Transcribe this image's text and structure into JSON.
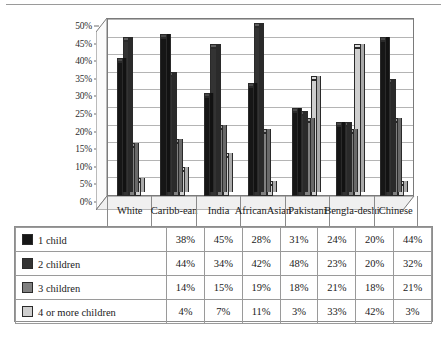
{
  "chart_data": {
    "type": "bar",
    "title": "",
    "xlabel": "",
    "ylabel": "",
    "ylim": [
      0,
      50
    ],
    "ytick_labels": [
      "0%",
      "5%",
      "10%",
      "15%",
      "20%",
      "25%",
      "30%",
      "35%",
      "40%",
      "45%",
      "50%"
    ],
    "ytick_values": [
      0,
      5,
      10,
      15,
      20,
      25,
      30,
      35,
      40,
      45,
      50
    ],
    "grid": true,
    "legend_position": "table",
    "categories": [
      "White",
      "Caribb-\nean",
      "India",
      "African\nAsian",
      "Pakistani",
      "Bengla-\ndeshi",
      "Chinese"
    ],
    "category_labels": [
      "White",
      "Caribb-ean",
      "India",
      "African Asian",
      "Pakistani",
      "Bengla-deshi",
      "Chinese"
    ],
    "series": [
      {
        "name": "1 child",
        "color": "#161616",
        "values": [
          38,
          45,
          28,
          31,
          24,
          20,
          44
        ]
      },
      {
        "name": "2 children",
        "color": "#333333",
        "values": [
          44,
          34,
          42,
          48,
          23,
          20,
          32
        ]
      },
      {
        "name": "3 children",
        "color": "#808080",
        "values": [
          14,
          15,
          19,
          18,
          21,
          18,
          21
        ]
      },
      {
        "name": "4 or more children",
        "color": "#cfcfcf",
        "values": [
          4,
          7,
          11,
          3,
          33,
          42,
          3
        ]
      }
    ]
  },
  "table": {
    "column_headers": [
      "",
      "White",
      "Caribb-ean",
      "India",
      "African Asian",
      "Pakistani",
      "Bengla-deshi",
      "Chinese"
    ],
    "rows": [
      {
        "label": "1 child",
        "swatch": "#161616",
        "values": [
          "38%",
          "45%",
          "28%",
          "31%",
          "24%",
          "20%",
          "44%"
        ]
      },
      {
        "label": "2 children",
        "swatch": "#333333",
        "values": [
          "44%",
          "34%",
          "42%",
          "48%",
          "23%",
          "20%",
          "32%"
        ]
      },
      {
        "label": "3 children",
        "swatch": "#808080",
        "values": [
          "14%",
          "15%",
          "19%",
          "18%",
          "21%",
          "18%",
          "21%"
        ]
      },
      {
        "label": "4 or more children",
        "swatch": "#cfcfcf",
        "values": [
          "4%",
          "7%",
          "11%",
          "3%",
          "33%",
          "42%",
          "3%"
        ]
      }
    ]
  },
  "colors": {
    "series_1": "#161616",
    "series_2": "#333333",
    "series_3": "#808080",
    "series_4": "#cfcfcf",
    "grid": "#b4b4b4",
    "axis": "#7a7a7a",
    "floor": "#e8e8e8"
  }
}
